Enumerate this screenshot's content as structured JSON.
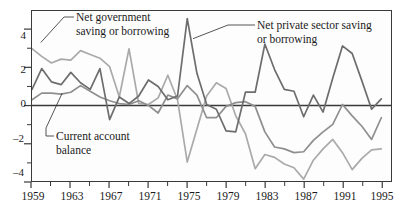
{
  "chart_data": {
    "type": "line",
    "title": "",
    "subtitle": "",
    "xlabel": "",
    "ylabel": "",
    "xlim": [
      1959,
      1996
    ],
    "ylim": [
      -4,
      5
    ],
    "grid": false,
    "legend_position": "inline-annotations",
    "x": [
      1959,
      1960,
      1961,
      1962,
      1963,
      1964,
      1965,
      1966,
      1967,
      1968,
      1969,
      1970,
      1971,
      1972,
      1973,
      1974,
      1975,
      1976,
      1977,
      1978,
      1979,
      1980,
      1981,
      1982,
      1983,
      1984,
      1985,
      1986,
      1987,
      1988,
      1989,
      1990,
      1991,
      1992,
      1993,
      1994,
      1995
    ],
    "x_ticks_major": [
      1959,
      1963,
      1967,
      1971,
      1975,
      1979,
      1983,
      1987,
      1991,
      1995
    ],
    "x_ticks_minor": [
      1961,
      1965,
      1969,
      1973,
      1977,
      1981,
      1985,
      1989,
      1993
    ],
    "y_ticks_major": [
      4,
      2,
      0,
      -2,
      -4
    ],
    "y_ticks_minor": [
      3,
      1,
      -1,
      -3
    ],
    "zero_line": 0,
    "series": [
      {
        "name": "Net private sector saving or borrowing",
        "color": "#6d6d6d",
        "values": [
          0.85,
          1.95,
          1.25,
          1.1,
          1.75,
          1.2,
          0.85,
          1.95,
          -0.75,
          0.45,
          0.1,
          0.5,
          1.35,
          1.0,
          0.3,
          0.5,
          4.6,
          1.7,
          0.05,
          -0.2,
          -1.35,
          -1.4,
          0.7,
          0.7,
          3.25,
          1.9,
          0.85,
          0.75,
          -0.6,
          0.55,
          -0.35,
          1.45,
          3.15,
          2.75,
          1.3,
          -0.2,
          0.35
        ]
      },
      {
        "name": "Net government saving or borrowing",
        "color": "#aaaaaa",
        "values": [
          3.0,
          2.6,
          2.25,
          2.45,
          2.4,
          2.9,
          2.7,
          2.5,
          2.05,
          0.45,
          3.0,
          0.1,
          0.05,
          0.4,
          1.6,
          0.3,
          -3.0,
          -1.25,
          0.5,
          1.2,
          0.9,
          -0.55,
          -1.5,
          -3.35,
          -2.6,
          -2.75,
          -3.1,
          -3.3,
          -3.9,
          -2.9,
          -2.3,
          -1.8,
          -2.5,
          -3.4,
          -2.8,
          -2.35,
          -2.3
        ]
      },
      {
        "name": "Current account balance",
        "color": "#8f8f8f",
        "values": [
          0.3,
          0.65,
          0.65,
          0.6,
          0.7,
          1.05,
          0.75,
          0.45,
          0.25,
          0.1,
          0.05,
          0.25,
          0.0,
          -0.4,
          0.55,
          0.35,
          1.05,
          0.55,
          -0.65,
          -0.65,
          -0.05,
          0.15,
          0.2,
          -0.05,
          -1.4,
          -2.2,
          -2.3,
          -2.5,
          -2.45,
          -1.85,
          -1.4,
          -1.0,
          0.05,
          -0.55,
          -1.1,
          -1.8,
          -0.65
        ]
      }
    ],
    "annotations": [
      {
        "id": "net-government",
        "text": "Net government\nsaving or borrowing",
        "target_x": 1960,
        "target_y": 3.3
      },
      {
        "id": "net-private",
        "text": "Net private sector saving\nor borrowing",
        "target_x": 1975.6,
        "target_y": 3.5
      },
      {
        "id": "current-account",
        "text": "Current account\nbalance",
        "target_x": 1962.2,
        "target_y": 0.65
      }
    ]
  },
  "axis": {
    "y_labels": [
      "4",
      "2",
      "0",
      "–2",
      "–4"
    ],
    "x_labels": [
      "1959",
      "1963",
      "1967",
      "1971",
      "1975",
      "1979",
      "1983",
      "1987",
      "1991",
      "1995"
    ]
  },
  "annotations": {
    "net_government": "Net government\nsaving or borrowing",
    "net_private": "Net private sector saving\nor borrowing",
    "current_account": "Current account\nbalance"
  },
  "colors": {
    "private": "#6d6d6d",
    "government": "#aaaaaa",
    "current_account": "#8f8f8f",
    "axis": "#3a3a3a",
    "background": "#fdfdfd",
    "text": "#1a1a1a"
  }
}
